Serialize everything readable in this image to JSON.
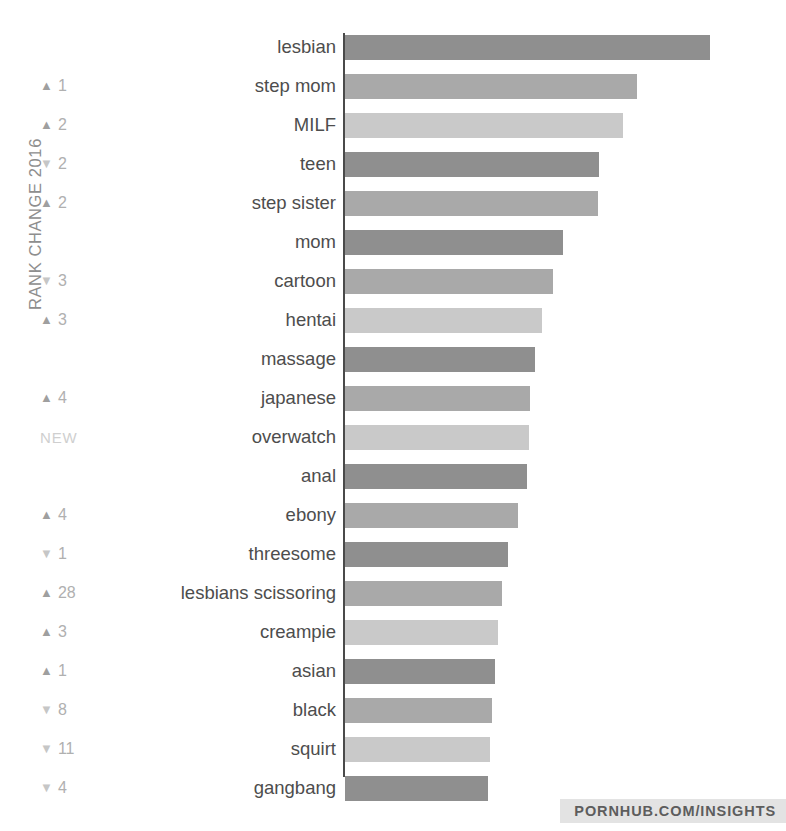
{
  "axis": {
    "rank_change_label": "RANK CHANGE 2016"
  },
  "footer": {
    "badge_text": "PORNHUB.COM/INSIGHTS"
  },
  "glyphs": {
    "up": "▲",
    "down": "▼",
    "new": "NEW"
  },
  "colors": {
    "bar_dark": "#8f8f8f",
    "bar_medium": "#a9a9a9",
    "bar_light": "#c9c9c9",
    "axis": "#4a4a4a",
    "label_text": "#4d4d4d",
    "rank_text": "#b0b0b0",
    "badge_bg": "#e3e3e3"
  },
  "chart_data": {
    "type": "bar",
    "orientation": "horizontal",
    "title": "",
    "xlabel": "",
    "ylabel": "RANK CHANGE 2016",
    "grid": false,
    "legend": "none",
    "categories": [
      "lesbian",
      "step mom",
      "MILF",
      "teen",
      "step sister",
      "mom",
      "cartoon",
      "hentai",
      "massage",
      "japanese",
      "overwatch",
      "anal",
      "ebony",
      "threesome",
      "lesbians scissoring",
      "creampie",
      "asian",
      "black",
      "squirt",
      "gangbang"
    ],
    "values": [
      100,
      80,
      71,
      62,
      62,
      55,
      54,
      52,
      51,
      50,
      50,
      49,
      48,
      45,
      43,
      42,
      41,
      40,
      39,
      38
    ],
    "xlim": [
      0,
      100
    ],
    "rows": [
      {
        "label": "lesbian",
        "value": 100,
        "bar_px": 365,
        "tone": "dark",
        "rank_dir": "",
        "rank_value": ""
      },
      {
        "label": "step mom",
        "value": 80,
        "bar_px": 292,
        "tone": "medium",
        "rank_dir": "up",
        "rank_value": "1"
      },
      {
        "label": "MILF",
        "value": 71,
        "bar_px": 278,
        "tone": "light",
        "rank_dir": "up",
        "rank_value": "2"
      },
      {
        "label": "teen",
        "value": 62,
        "bar_px": 254,
        "tone": "dark",
        "rank_dir": "down",
        "rank_value": "2"
      },
      {
        "label": "step sister",
        "value": 62,
        "bar_px": 253,
        "tone": "medium",
        "rank_dir": "up",
        "rank_value": "2"
      },
      {
        "label": "mom",
        "value": 55,
        "bar_px": 218,
        "tone": "dark",
        "rank_dir": "",
        "rank_value": ""
      },
      {
        "label": "cartoon",
        "value": 54,
        "bar_px": 208,
        "tone": "medium",
        "rank_dir": "down",
        "rank_value": "3"
      },
      {
        "label": "hentai",
        "value": 52,
        "bar_px": 197,
        "tone": "light",
        "rank_dir": "up",
        "rank_value": "3"
      },
      {
        "label": "massage",
        "value": 51,
        "bar_px": 190,
        "tone": "dark",
        "rank_dir": "",
        "rank_value": ""
      },
      {
        "label": "japanese",
        "value": 50,
        "bar_px": 185,
        "tone": "medium",
        "rank_dir": "up",
        "rank_value": "4"
      },
      {
        "label": "overwatch",
        "value": 50,
        "bar_px": 184,
        "tone": "light",
        "rank_dir": "new",
        "rank_value": ""
      },
      {
        "label": "anal",
        "value": 49,
        "bar_px": 182,
        "tone": "dark",
        "rank_dir": "",
        "rank_value": ""
      },
      {
        "label": "ebony",
        "value": 48,
        "bar_px": 173,
        "tone": "medium",
        "rank_dir": "up",
        "rank_value": "4"
      },
      {
        "label": "threesome",
        "value": 45,
        "bar_px": 163,
        "tone": "dark",
        "rank_dir": "down",
        "rank_value": "1"
      },
      {
        "label": "lesbians scissoring",
        "value": 43,
        "bar_px": 157,
        "tone": "medium",
        "rank_dir": "up",
        "rank_value": "28"
      },
      {
        "label": "creampie",
        "value": 42,
        "bar_px": 153,
        "tone": "light",
        "rank_dir": "up",
        "rank_value": "3"
      },
      {
        "label": "asian",
        "value": 41,
        "bar_px": 150,
        "tone": "dark",
        "rank_dir": "up",
        "rank_value": "1"
      },
      {
        "label": "black",
        "value": 40,
        "bar_px": 147,
        "tone": "medium",
        "rank_dir": "down",
        "rank_value": "8"
      },
      {
        "label": "squirt",
        "value": 39,
        "bar_px": 145,
        "tone": "light",
        "rank_dir": "down",
        "rank_value": "11"
      },
      {
        "label": "gangbang",
        "value": 38,
        "bar_px": 143,
        "tone": "dark",
        "rank_dir": "down",
        "rank_value": "4"
      }
    ]
  }
}
